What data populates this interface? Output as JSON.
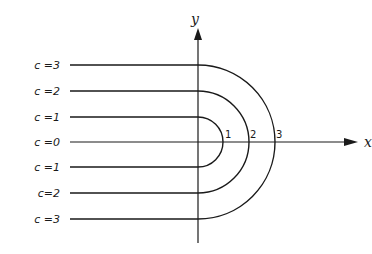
{
  "axes": {
    "x_label": "x",
    "y_label": "y",
    "origin": [
      198,
      142
    ],
    "x_axis_end": 358,
    "y_axis_top": 28,
    "y_axis_bottom": 243
  },
  "ticks": [
    {
      "label": "1",
      "x": 225,
      "y": 138
    },
    {
      "label": "2",
      "x": 250,
      "y": 138
    },
    {
      "label": "3",
      "x": 276,
      "y": 138
    }
  ],
  "curves": [
    {
      "c": "3",
      "label_top": "c =3",
      "label_bottom": "c =3",
      "radius": 77
    },
    {
      "c": "2",
      "label_top": "c =2",
      "label_bottom": "c=2",
      "radius": 51
    },
    {
      "c": "1",
      "label_top": "c =1",
      "label_bottom": "c =1",
      "radius": 25
    }
  ],
  "center_line": {
    "label": "c =0"
  },
  "line_start_x": 70,
  "stroke_color": "#1a1a1a"
}
